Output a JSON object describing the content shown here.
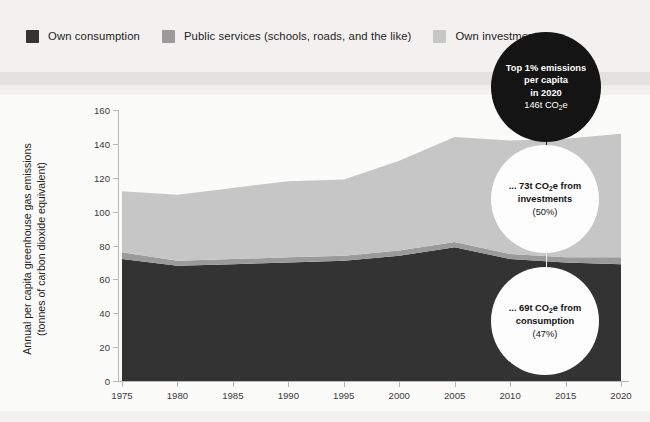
{
  "legend": {
    "items": [
      {
        "label": "Own consumption",
        "color": "#333333",
        "icon": "square-swatch-icon"
      },
      {
        "label": "Public services (schools, roads, and the like)",
        "color": "#9a9a9a",
        "icon": "square-swatch-icon"
      },
      {
        "label": "Own investments",
        "color": "#c6c6c6",
        "icon": "square-swatch-icon"
      }
    ]
  },
  "axes": {
    "ylabel_line1": "Annual per capita greenhouse gas emissions",
    "ylabel_line2": "(tonnes of carbon dioxide equivalent)",
    "yticks": [
      "160",
      "140",
      "120",
      "100",
      "80",
      "60",
      "40",
      "20",
      "0"
    ],
    "xticks": [
      "1975",
      "1980",
      "1985",
      "1990",
      "1995",
      "2000",
      "2005",
      "2010",
      "2015",
      "2020"
    ]
  },
  "annotations": [
    {
      "name": "total-bubble",
      "style": "dark",
      "line1": "Top 1% emissions",
      "line2": "per capita",
      "line3": "in 2020",
      "line4_pre": "146t CO",
      "line4_sub": "2",
      "line4_post": "e"
    },
    {
      "name": "investments-bubble",
      "style": "light",
      "line1_pre": "... 73t CO",
      "line1_sub": "2",
      "line1_post": "e from",
      "line2": "investments",
      "line3": "(50%)"
    },
    {
      "name": "consumption-bubble",
      "style": "light",
      "line1_pre": "... 69t CO",
      "line1_sub": "2",
      "line1_post": "e from",
      "line2": "consumption",
      "line3": "(47%)"
    }
  ],
  "chart_data": {
    "type": "area",
    "title": "",
    "xlabel": "",
    "ylabel": "Annual per capita greenhouse gas emissions (tonnes of carbon dioxide equivalent)",
    "xlim": [
      1975,
      2020
    ],
    "ylim": [
      0,
      160
    ],
    "grid": false,
    "legend_position": "top-left",
    "stacked": true,
    "x": [
      1975,
      1980,
      1985,
      1990,
      1995,
      2000,
      2005,
      2010,
      2015,
      2020
    ],
    "series": [
      {
        "name": "Own consumption",
        "color": "#333333",
        "values": [
          72,
          68,
          69,
          70,
          71,
          74,
          79,
          72,
          70,
          69
        ]
      },
      {
        "name": "Public services (schools, roads, and the like)",
        "color": "#9a9a9a",
        "values": [
          4,
          3,
          3,
          3,
          3,
          3,
          3,
          3,
          3,
          4
        ]
      },
      {
        "name": "Own investments",
        "color": "#c6c6c6",
        "values": [
          36,
          39,
          42,
          45,
          45,
          53,
          62,
          67,
          70,
          73
        ]
      }
    ],
    "totals": [
      112,
      110,
      114,
      118,
      119,
      130,
      144,
      142,
      143,
      146
    ]
  },
  "colors": {
    "background": "#f2f1ef",
    "panel": "#fbfbfa",
    "consumption": "#333333",
    "public_services": "#9a9a9a",
    "investments": "#c6c6c6",
    "axis": "#b9b9b7",
    "bubble_dark": "#141414",
    "bubble_light": "#fdfdfd"
  }
}
